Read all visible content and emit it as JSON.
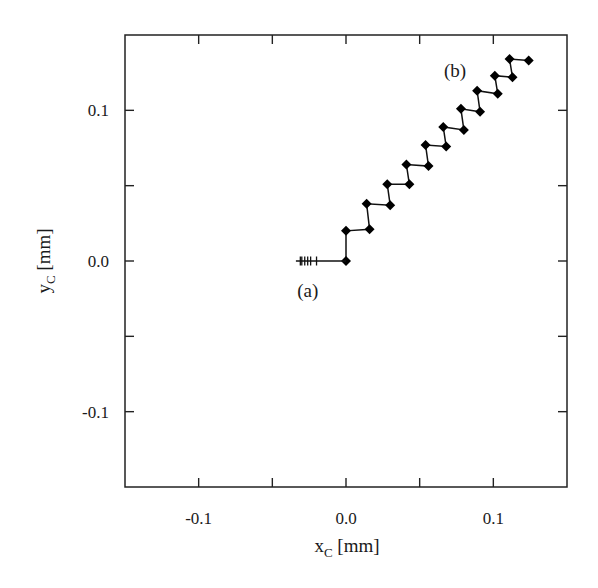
{
  "chart_data": {
    "type": "line",
    "title": "",
    "xlabel": "x_C [mm]",
    "xlabel_main": "x",
    "xlabel_sub": "C",
    "xlabel_unit": " [mm]",
    "ylabel": "y_C [mm]",
    "ylabel_main": "y",
    "ylabel_sub": "C",
    "ylabel_unit": " [mm]",
    "xlim": [
      -0.15,
      0.15
    ],
    "ylim": [
      -0.15,
      0.15
    ],
    "grid": false,
    "legend": null,
    "x_ticks": [
      -0.1,
      -0.05,
      0.0,
      0.05,
      0.1
    ],
    "x_tick_labels": [
      {
        "value": -0.1,
        "label": "-0.1"
      },
      {
        "value": 0.0,
        "label": "0.0"
      },
      {
        "value": 0.1,
        "label": "0.1"
      }
    ],
    "y_ticks": [
      -0.1,
      -0.05,
      0.0,
      0.05,
      0.1
    ],
    "y_tick_labels": [
      {
        "value": 0.1,
        "label": "0.1"
      },
      {
        "value": 0.0,
        "label": "0.0"
      },
      {
        "value": -0.1,
        "label": "-0.1"
      }
    ],
    "annotations": [
      {
        "text": "(a)",
        "x": -0.026,
        "y": -0.019
      },
      {
        "text": "(b)",
        "x": 0.074,
        "y": 0.127
      }
    ],
    "series": [
      {
        "name": "trajectory",
        "marker": "diamond",
        "x": [
          0.0,
          0.0,
          0.016,
          0.014,
          0.03,
          0.028,
          0.043,
          0.041,
          0.056,
          0.054,
          0.068,
          0.066,
          0.08,
          0.078,
          0.091,
          0.089,
          0.103,
          0.101,
          0.113,
          0.111,
          0.124
        ],
        "y": [
          0.0,
          0.02,
          0.021,
          0.038,
          0.037,
          0.051,
          0.051,
          0.064,
          0.063,
          0.077,
          0.076,
          0.089,
          0.087,
          0.101,
          0.099,
          0.113,
          0.111,
          0.123,
          0.122,
          0.134,
          0.133
        ]
      },
      {
        "name": "initial-approach",
        "marker": "vertical-tick",
        "line_start": {
          "x": -0.034,
          "y": 0.0
        },
        "x": [
          -0.031,
          -0.03,
          -0.028,
          -0.026,
          -0.024,
          -0.02
        ],
        "y": [
          0.0,
          0.0,
          0.0,
          0.0,
          0.0,
          0.0
        ]
      }
    ]
  },
  "colors": {
    "axis": "#222222",
    "series": "#000000",
    "background": "#ffffff"
  }
}
